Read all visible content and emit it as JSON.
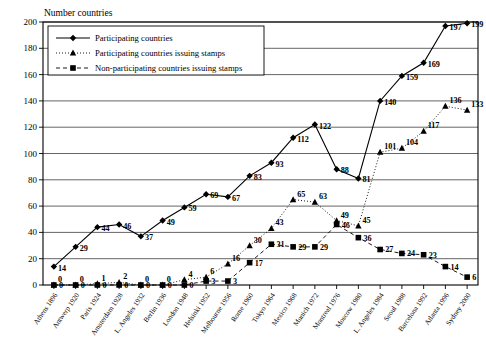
{
  "chart_data": {
    "type": "line",
    "title": "",
    "ylabel": "Number countries",
    "xlabel": "",
    "ylim": [
      0,
      200
    ],
    "ytick_step": 20,
    "grid": true,
    "legend_position": "top-left",
    "yticks": [
      0,
      20,
      40,
      60,
      80,
      100,
      120,
      140,
      160,
      180,
      200
    ],
    "categories": [
      "Athens 1896",
      "Antwerp 1920",
      "Paris 1924",
      "Amsterdam 1928",
      "L. Angeles 1932",
      "Berlin 1936",
      "London 1948",
      "Helsinki 1952",
      "Melbourne 1956",
      "Rome 1960",
      "Tokyo 1964",
      "Mexico 1968",
      "Munich 1972",
      "Montreal 1976",
      "Moscow 1980",
      "L. Angeles 1984",
      "Seoul 1988",
      "Barcelona 1992",
      "Atlanta 1996",
      "Sydney 2000"
    ],
    "series": [
      {
        "name": "Participating countries",
        "marker": "diamond",
        "linestyle": "solid",
        "values": [
          14,
          29,
          44,
          46,
          37,
          49,
          59,
          69,
          67,
          83,
          93,
          112,
          122,
          88,
          81,
          140,
          159,
          169,
          197,
          199
        ]
      },
      {
        "name": "Participating countries issuing stamps",
        "marker": "triangle",
        "linestyle": "dotted",
        "values": [
          0,
          0,
          1,
          2,
          0,
          0,
          4,
          6,
          16,
          30,
          43,
          65,
          63,
          49,
          45,
          101,
          104,
          117,
          136,
          133
        ]
      },
      {
        "name": "Non-participating countries issuing stamps",
        "marker": "square",
        "linestyle": "dashed",
        "values": [
          0,
          0,
          0,
          0,
          0,
          0,
          0,
          3,
          3,
          17,
          31,
          29,
          29,
          46,
          36,
          27,
          24,
          23,
          14,
          6
        ]
      }
    ]
  },
  "legend": {
    "items": [
      "Participating countries",
      "Participating countries issuing stamps",
      "Non-participating countries issuing stamps"
    ]
  }
}
